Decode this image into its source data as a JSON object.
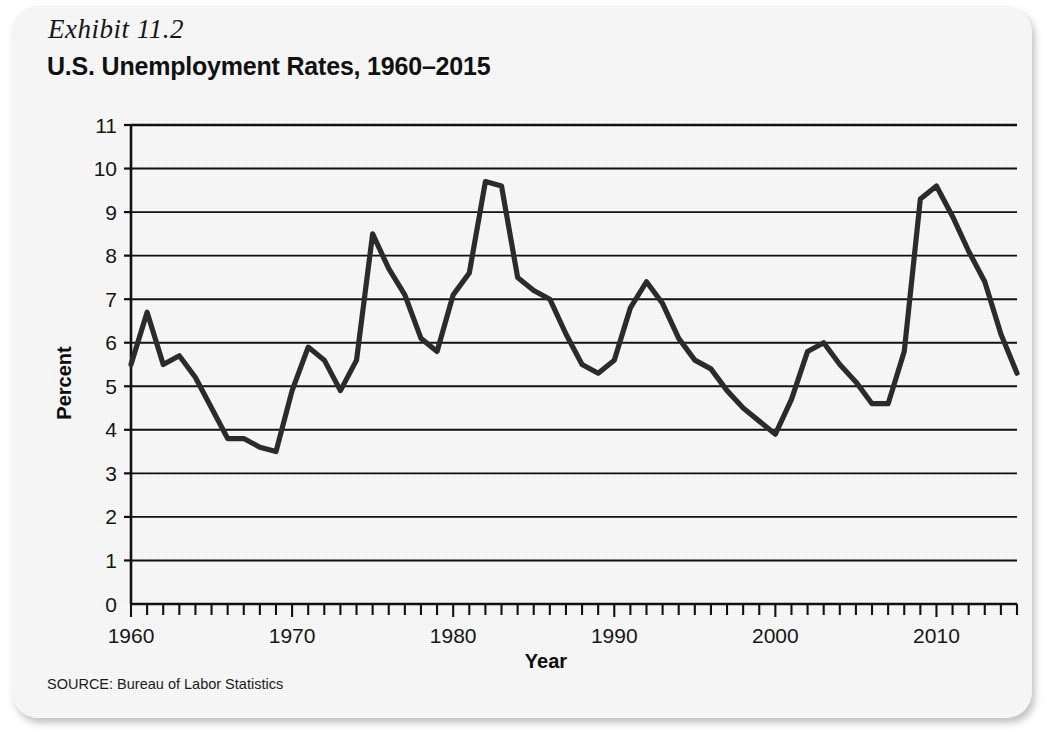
{
  "exhibit": {
    "label": "Exhibit 11.2",
    "title": "U.S. Unemployment Rates, 1960–2015"
  },
  "source": {
    "text": "SOURCE: Bureau of Labor Statistics"
  },
  "style": {
    "card_bg": "#eeeeee",
    "page_bg": "#ffffff",
    "line_color": "#2b2b2b",
    "grid_color": "#111111",
    "axis_color": "#111111",
    "text_color": "#161616"
  },
  "chart_data": {
    "type": "line",
    "title": "U.S. Unemployment Rates, 1960–2015",
    "xlabel": "Year",
    "ylabel": "Percent",
    "xlim": [
      1960,
      2015
    ],
    "ylim": [
      0,
      11
    ],
    "ytick_step": 1,
    "yticks": [
      0,
      1,
      2,
      3,
      4,
      5,
      6,
      7,
      8,
      9,
      10,
      11
    ],
    "xticks_labeled": [
      1960,
      1970,
      1980,
      1990,
      2000,
      2010
    ],
    "xtick_minor_step": 1,
    "grid": "horizontal",
    "legend": "none",
    "series": [
      {
        "name": "U.S. unemployment rate",
        "x": [
          1960,
          1961,
          1962,
          1963,
          1964,
          1965,
          1966,
          1967,
          1968,
          1969,
          1970,
          1971,
          1972,
          1973,
          1974,
          1975,
          1976,
          1977,
          1978,
          1979,
          1980,
          1981,
          1982,
          1983,
          1984,
          1985,
          1986,
          1987,
          1988,
          1989,
          1990,
          1991,
          1992,
          1993,
          1994,
          1995,
          1996,
          1997,
          1998,
          1999,
          2000,
          2001,
          2002,
          2003,
          2004,
          2005,
          2006,
          2007,
          2008,
          2009,
          2010,
          2011,
          2012,
          2013,
          2014,
          2015
        ],
        "values": [
          5.5,
          6.7,
          5.5,
          5.7,
          5.2,
          4.5,
          3.8,
          3.8,
          3.6,
          3.5,
          4.9,
          5.9,
          5.6,
          4.9,
          5.6,
          8.5,
          7.7,
          7.1,
          6.1,
          5.8,
          7.1,
          7.6,
          9.7,
          9.6,
          7.5,
          7.2,
          7.0,
          6.2,
          5.5,
          5.3,
          5.6,
          6.8,
          7.4,
          6.9,
          6.1,
          5.6,
          5.4,
          4.9,
          4.5,
          4.2,
          3.9,
          4.7,
          5.8,
          6.0,
          5.5,
          5.1,
          4.6,
          4.6,
          5.8,
          9.3,
          9.6,
          8.9,
          8.1,
          7.4,
          6.2,
          5.3
        ]
      }
    ]
  }
}
